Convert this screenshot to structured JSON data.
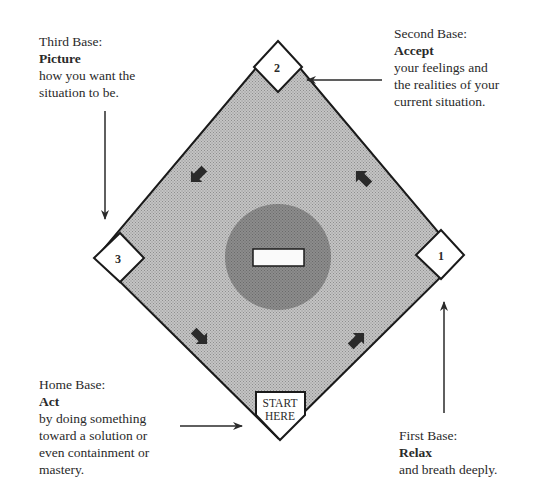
{
  "diagram": {
    "type": "baseball-diamond",
    "colors": {
      "field": "#b9b9b9",
      "circle": "#8a8a8a",
      "outline": "#1a1a1a",
      "arrow": "#2a2a2a",
      "base": "#ffffff",
      "text": "#2a2a2a"
    },
    "bases": {
      "first": {
        "number": "1",
        "title": "First Base:",
        "verb": "Relax",
        "desc_lines": [
          "and breath deeply."
        ]
      },
      "second": {
        "number": "2",
        "title": "Second Base:",
        "verb": "Accept",
        "desc_lines": [
          "your feelings and",
          "the realities of your",
          "current situation."
        ]
      },
      "third": {
        "number": "3",
        "title": "Third Base:",
        "verb": "Picture",
        "desc_lines": [
          "how you want the",
          "situation to be."
        ]
      },
      "home": {
        "plate_lines": [
          "START",
          "HERE"
        ],
        "title": "Home Base:",
        "verb": "Act",
        "desc_lines": [
          "by doing something",
          "toward a solution or",
          "even containment or",
          "mastery."
        ]
      }
    },
    "flow_arrows": [
      "home-to-first",
      "first-to-second",
      "second-to-third",
      "third-to-home"
    ]
  }
}
